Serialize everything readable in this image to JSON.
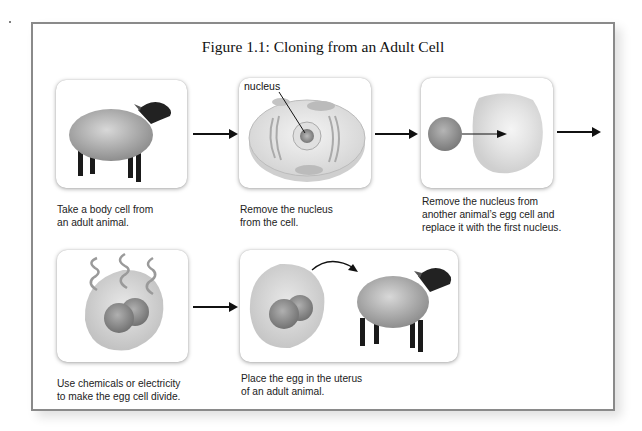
{
  "figure": {
    "title": "Figure 1.1: Cloning from an Adult Cell",
    "steps": [
      {
        "image": "adult-sheep",
        "caption_lines": [
          "Take a body cell from",
          "an adult animal."
        ]
      },
      {
        "image": "animal-cell-diagram",
        "label": "nucleus",
        "caption_lines": [
          "Remove the nucleus",
          "from the cell."
        ]
      },
      {
        "image": "nucleus-transfer-to-egg",
        "caption_lines": [
          "Remove the nucleus from",
          "another animal’s egg cell and",
          "replace it with the first nucleus."
        ]
      },
      {
        "image": "dividing-egg-cell",
        "caption_lines": [
          "Use chemicals or electricity",
          "to make the egg cell divide."
        ]
      },
      {
        "image": "egg-to-sheep",
        "caption_lines": [
          "Place the egg in the uterus",
          "of an adult animal."
        ]
      }
    ],
    "colors": {
      "frame_border": "#8a8a8a",
      "arrow": "#111111",
      "text": "#222222"
    }
  }
}
